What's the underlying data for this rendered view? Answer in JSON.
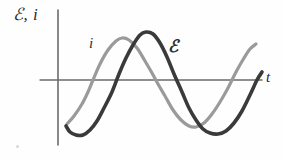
{
  "figure": {
    "background_color": "#fefefe",
    "yaxis_label": "ℰ, i",
    "xaxis_label": "t",
    "current_label": "i",
    "emf_label": "ℰ"
  },
  "chart_data": {
    "type": "line",
    "title": "",
    "subtitle": "",
    "xlabel": "t",
    "ylabel": "ℰ, i",
    "grid": false,
    "legend_position": "inline-annotations",
    "axes": {
      "x_axis_y_pixel": 80,
      "y_axis_x_pixel": 58,
      "x_axis_start_px": 40,
      "x_axis_end_px": 262,
      "y_axis_top_px": 10,
      "y_axis_bottom_px": 145,
      "ticks": [],
      "tick_labels": [],
      "arrowheads": false
    },
    "annotations": [
      {
        "text": "i",
        "x_px": 92,
        "y_px": 45,
        "target_series": "i"
      },
      {
        "text": "ℰ",
        "x_px": 173,
        "y_px": 48,
        "target_series": "ℰ"
      }
    ],
    "phase_relationship": "current leads emf by about one quarter period (90 degrees)",
    "series": [
      {
        "name": "i",
        "label": "i",
        "color": "#9a9a9a",
        "line_width": 3.2,
        "description": "current, light gray sinusoid, leads the emf curve",
        "amplitude_px": 45,
        "period_px": 156,
        "phase_shift_px": -23,
        "zero_crossings_px": [
          88,
          160,
          243
        ],
        "peaks_px": [
          {
            "x": 122,
            "y": 38
          }
        ],
        "troughs_px": [
          {
            "x": 195,
            "y": 127
          }
        ],
        "start_point_px": {
          "x": 67,
          "y": 124
        },
        "end_point_px": {
          "x": 256,
          "y": 44
        },
        "points_px": [
          [
            67,
            124
          ],
          [
            74,
            116
          ],
          [
            82,
            104
          ],
          [
            88,
            92
          ],
          [
            93,
            80
          ],
          [
            100,
            64
          ],
          [
            108,
            50
          ],
          [
            116,
            41
          ],
          [
            122,
            38
          ],
          [
            129,
            40
          ],
          [
            137,
            48
          ],
          [
            145,
            61
          ],
          [
            152,
            73
          ],
          [
            158,
            84
          ],
          [
            165,
            96
          ],
          [
            173,
            110
          ],
          [
            181,
            120
          ],
          [
            189,
            126
          ],
          [
            196,
            127
          ],
          [
            204,
            123
          ],
          [
            212,
            114
          ],
          [
            220,
            102
          ],
          [
            228,
            88
          ],
          [
            236,
            72
          ],
          [
            244,
            58
          ],
          [
            250,
            49
          ],
          [
            256,
            44
          ]
        ]
      },
      {
        "name": "ℰ",
        "label": "ℰ",
        "color": "#3a3a3a",
        "line_width": 3.6,
        "description": "electromotive force, dark sinusoid, lags the current curve",
        "amplitude_px": 48,
        "period_px": 156,
        "phase_shift_px": 0,
        "zero_crossings_px": [
          112,
          182
        ],
        "peaks_px": [
          {
            "x": 145,
            "y": 32
          }
        ],
        "troughs_px": [
          {
            "x": 80,
            "y": 135
          },
          {
            "x": 218,
            "y": 133
          }
        ],
        "start_point_px": {
          "x": 66,
          "y": 126
        },
        "end_point_px": {
          "x": 262,
          "y": 72
        },
        "points_px": [
          [
            66,
            126
          ],
          [
            70,
            132
          ],
          [
            76,
            135
          ],
          [
            83,
            135
          ],
          [
            90,
            130
          ],
          [
            97,
            121
          ],
          [
            104,
            108
          ],
          [
            112,
            92
          ],
          [
            119,
            74
          ],
          [
            126,
            58
          ],
          [
            133,
            45
          ],
          [
            140,
            35
          ],
          [
            146,
            32
          ],
          [
            153,
            34
          ],
          [
            160,
            43
          ],
          [
            167,
            57
          ],
          [
            174,
            74
          ],
          [
            182,
            92
          ],
          [
            189,
            108
          ],
          [
            196,
            120
          ],
          [
            203,
            129
          ],
          [
            210,
            133
          ],
          [
            218,
            134
          ],
          [
            226,
            131
          ],
          [
            234,
            123
          ],
          [
            242,
            111
          ],
          [
            250,
            95
          ],
          [
            257,
            80
          ],
          [
            262,
            72
          ]
        ]
      }
    ]
  }
}
